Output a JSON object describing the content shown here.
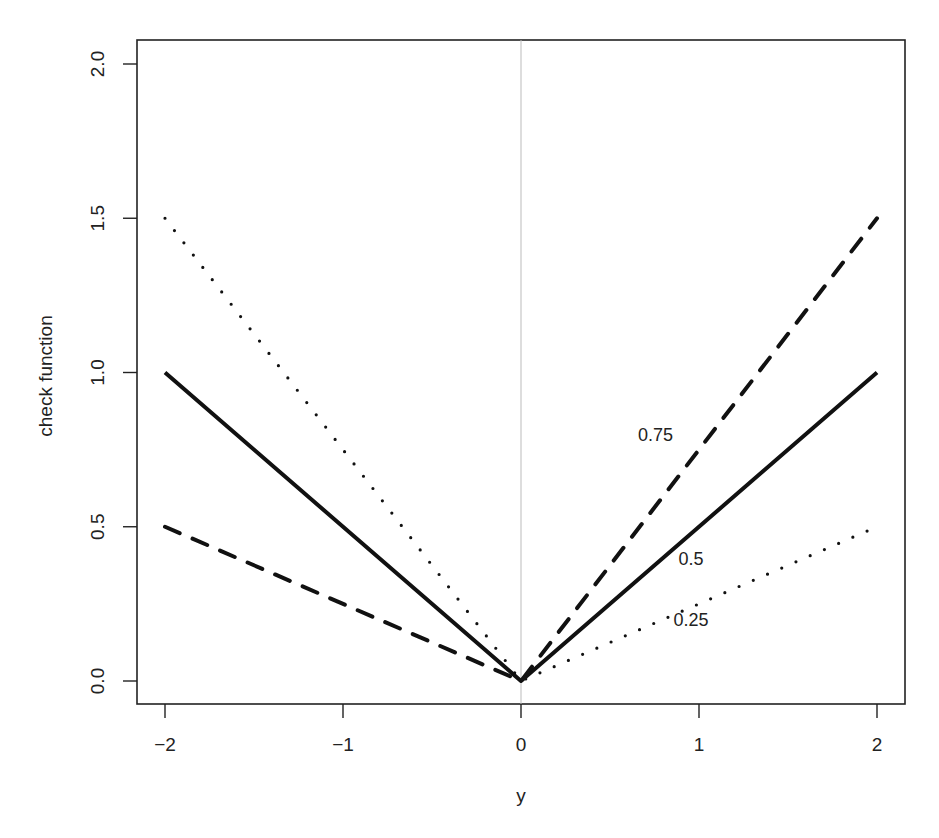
{
  "chart_data": {
    "type": "line",
    "title": "",
    "xlabel": "y",
    "ylabel": "check function",
    "xlim": [
      -2.16,
      2.16
    ],
    "ylim": [
      -0.08,
      2.08
    ],
    "x_ticks": [
      -2,
      -1,
      0,
      1,
      2
    ],
    "x_tick_labels": [
      "−2",
      "−1",
      "0",
      "1",
      "2"
    ],
    "y_ticks": [
      0.0,
      0.5,
      1.0,
      1.5,
      2.0
    ],
    "y_tick_labels": [
      "0.0",
      "0.5",
      "1.0",
      "1.5",
      "2.0"
    ],
    "grid": false,
    "legend": "none (inline labels)",
    "reference_lines": [
      {
        "orientation": "vertical",
        "x": 0,
        "color": "#bbbbbb"
      }
    ],
    "x": [
      -2,
      0,
      2
    ],
    "series": [
      {
        "name": "0.25",
        "tau": 0.25,
        "style": "dotted",
        "values": [
          1.5,
          0.0,
          0.5
        ],
        "label": "0.25",
        "label_pos": [
          1.0,
          0.2
        ]
      },
      {
        "name": "0.5",
        "tau": 0.5,
        "style": "solid",
        "values": [
          1.0,
          0.0,
          1.0
        ],
        "label": "0.5",
        "label_pos": [
          1.0,
          0.4
        ]
      },
      {
        "name": "0.75",
        "tau": 0.75,
        "style": "dashed",
        "values": [
          0.5,
          0.0,
          1.5
        ],
        "label": "0.75",
        "label_pos": [
          0.8,
          0.8
        ]
      }
    ]
  },
  "colors": {
    "background": "#ffffff",
    "axis": "#222222",
    "line": "#111111",
    "reference_line": "#bbbbbb"
  }
}
